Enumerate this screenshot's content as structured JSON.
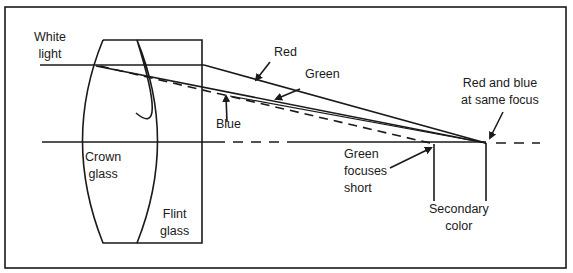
{
  "diagram": {
    "colors": {
      "line": "#1a1a1a",
      "background": "#ffffff"
    },
    "labels": {
      "white_light": [
        "White",
        "light"
      ],
      "red": "Red",
      "green": "Green",
      "blue": "Blue",
      "red_blue_focus": [
        "Red and blue",
        "at same focus"
      ],
      "crown_glass": [
        "Crown",
        "glass"
      ],
      "flint_glass": [
        "Flint",
        "glass"
      ],
      "green_short": [
        "Green",
        "focuses",
        "short"
      ],
      "secondary_color": [
        "Secondary",
        "color"
      ]
    }
  }
}
